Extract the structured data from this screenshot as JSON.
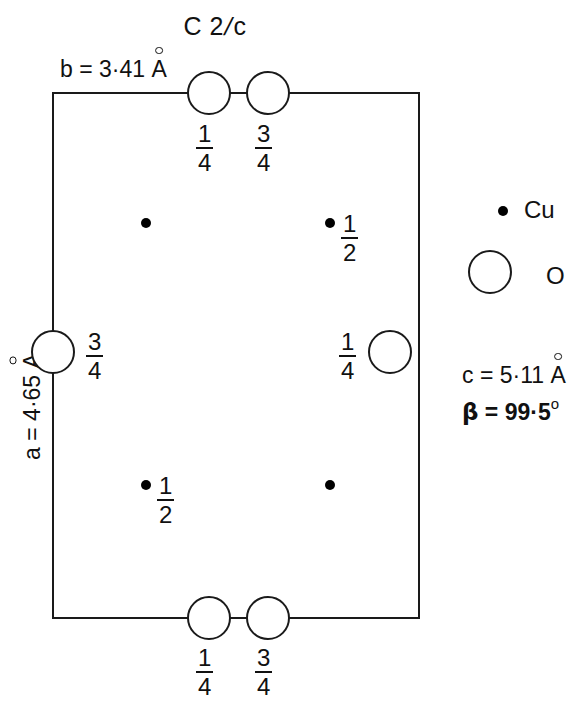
{
  "diagram": {
    "title": "C 2/c",
    "title_parts": {
      "before": "C 2",
      "slash": "/",
      "after": "c"
    },
    "type": "crystal-structure-unit-cell",
    "axes": {
      "b_label": "b = 3·41 Å",
      "b_prefix": "b = 3·41",
      "a_label": "a = 4·65 Å",
      "a_prefix": "a = 4·65",
      "c_label": "c = 5·11 Å",
      "c_prefix": "c = 5·11",
      "beta_symbol": "β",
      "beta_label": "β = 99·5°",
      "beta_value": " = 99·5",
      "beta_degree": "o",
      "angstrom": "A"
    },
    "cell": {
      "x0": 53,
      "y0": 93,
      "x1": 419,
      "y1": 618,
      "stroke": "#1a1a1a",
      "stroke_width": 2
    },
    "colors": {
      "line": "#1a1a1a",
      "atom_fill": "#ffffff",
      "cu_fill": "#000000",
      "background": "#ffffff"
    },
    "oxygen_atoms": [
      {
        "name": "o-top-left",
        "cx": 209,
        "cy": 93,
        "r": 21,
        "label": {
          "num": "1",
          "den": "4"
        },
        "label_x": 196,
        "label_y": 121
      },
      {
        "name": "o-top-right",
        "cx": 268,
        "cy": 93,
        "r": 21,
        "label": {
          "num": "3",
          "den": "4"
        },
        "label_x": 255,
        "label_y": 121
      },
      {
        "name": "o-left-mid",
        "cx": 53,
        "cy": 352,
        "r": 21,
        "label": {
          "num": "3",
          "den": "4"
        },
        "label_x": 86,
        "label_y": 329
      },
      {
        "name": "o-right-mid",
        "cx": 390,
        "cy": 352,
        "r": 21,
        "label": {
          "num": "1",
          "den": "4"
        },
        "label_x": 339,
        "label_y": 329
      },
      {
        "name": "o-bottom-left",
        "cx": 209,
        "cy": 618,
        "r": 21,
        "label": {
          "num": "1",
          "den": "4"
        },
        "label_x": 196,
        "label_y": 645
      },
      {
        "name": "o-bottom-right",
        "cx": 268,
        "cy": 618,
        "r": 21,
        "label": {
          "num": "3",
          "den": "4"
        },
        "label_x": 255,
        "label_y": 645
      }
    ],
    "copper_atoms": [
      {
        "name": "cu-upper-left",
        "cx": 146,
        "cy": 223,
        "r": 5,
        "label": null
      },
      {
        "name": "cu-upper-right",
        "cx": 330,
        "cy": 223,
        "r": 5,
        "label": {
          "num": "1",
          "den": "2"
        },
        "label_x": 341,
        "label_y": 211
      },
      {
        "name": "cu-lower-left",
        "cx": 146,
        "cy": 485,
        "r": 5,
        "label": {
          "num": "1",
          "den": "2"
        },
        "label_x": 157,
        "label_y": 473
      },
      {
        "name": "cu-lower-right",
        "cx": 330,
        "cy": 485,
        "r": 5,
        "label": null
      }
    ],
    "legend": [
      {
        "name": "legend-cu",
        "symbol": "dot",
        "text": "Cu",
        "cx": 503,
        "cy": 211,
        "r": 5
      },
      {
        "name": "legend-o",
        "symbol": "circle",
        "text": "O",
        "cx": 490,
        "cy": 272,
        "r": 21
      }
    ]
  }
}
